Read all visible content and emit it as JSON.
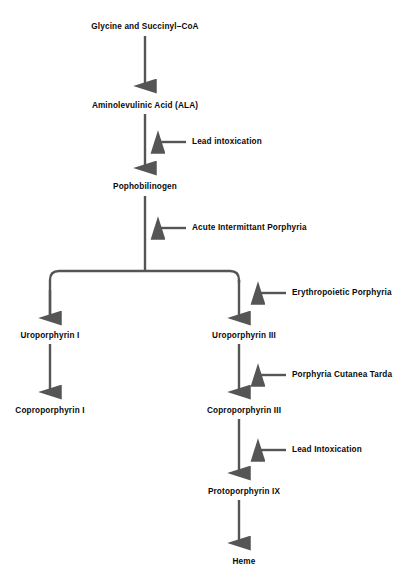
{
  "diagram": {
    "type": "flowchart",
    "colors": {
      "background": "#ffffff",
      "arrow": "#555555",
      "text": "#0a0a0a"
    },
    "nodes": [
      {
        "id": "glycine",
        "label": "Glycine and Succinyl–CoA",
        "x": 145,
        "y": 27,
        "align": "center"
      },
      {
        "id": "ala",
        "label": "Aminolevulinic Acid (ALA)",
        "x": 145,
        "y": 106,
        "align": "center"
      },
      {
        "id": "pophobilinogen",
        "label": "Pophobilinogen",
        "x": 145,
        "y": 188,
        "align": "center"
      },
      {
        "id": "uroporphyrin1",
        "label": "Uroporphyrin I",
        "x": 50,
        "y": 336,
        "align": "center"
      },
      {
        "id": "uroporphyrin3",
        "label": "Uroporphyrin III",
        "x": 244,
        "y": 336,
        "align": "center"
      },
      {
        "id": "coproporphyrin1",
        "label": "Coproporphyrin I",
        "x": 50,
        "y": 411,
        "align": "center"
      },
      {
        "id": "coproporphyrin3",
        "label": "Coproporphyrin III",
        "x": 244,
        "y": 411,
        "align": "center"
      },
      {
        "id": "protoporphyrin",
        "label": "Protoporphyrin IX",
        "x": 244,
        "y": 492,
        "align": "center"
      },
      {
        "id": "heme",
        "label": "Heme",
        "x": 244,
        "y": 562,
        "align": "center"
      }
    ],
    "modifiers": [
      {
        "id": "lead-intoxication-ala",
        "label": "Lead intoxication",
        "x": 190,
        "y": 143,
        "target": "ala-to-pophobilinogen"
      },
      {
        "id": "acute-intermittant",
        "label": "Acute Intermittant Porphyria",
        "x": 190,
        "y": 229,
        "target": "pophobilinogen-branch"
      },
      {
        "id": "erythropoietic",
        "label": "Erythropoietic Porphyria",
        "x": 290,
        "y": 294,
        "target": "branch-to-uroporphyrin3"
      },
      {
        "id": "porphyria-cutanea-tarda",
        "label": "Porphyria Cutanea Tarda",
        "x": 290,
        "y": 376,
        "target": "uroporphyrin3-to-coproporphyrin3"
      },
      {
        "id": "lead-intoxication-copro",
        "label": "Lead Intoxication",
        "x": 290,
        "y": 451,
        "target": "coproporphyrin3-to-protoporphyrin"
      }
    ],
    "edges": [
      {
        "id": "glycine-to-ala",
        "from": "glycine",
        "to": "ala"
      },
      {
        "id": "ala-to-pophobilinogen",
        "from": "ala",
        "to": "pophobilinogen"
      },
      {
        "id": "pophobilinogen-branch",
        "from": "pophobilinogen",
        "to": "branch"
      },
      {
        "id": "branch-to-uroporphyrin1",
        "from": "branch",
        "to": "uroporphyrin1"
      },
      {
        "id": "branch-to-uroporphyrin3",
        "from": "branch",
        "to": "uroporphyrin3"
      },
      {
        "id": "uroporphyrin1-to-coproporphyrin1",
        "from": "uroporphyrin1",
        "to": "coproporphyrin1"
      },
      {
        "id": "uroporphyrin3-to-coproporphyrin3",
        "from": "uroporphyrin3",
        "to": "coproporphyrin3"
      },
      {
        "id": "coproporphyrin3-to-protoporphyrin",
        "from": "coproporphyrin3",
        "to": "protoporphyrin"
      },
      {
        "id": "protoporphyrin-to-heme",
        "from": "protoporphyrin",
        "to": "heme"
      }
    ]
  }
}
